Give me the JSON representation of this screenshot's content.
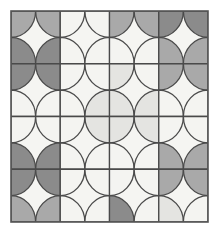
{
  "figure": {
    "background_color": "#ffffff"
  },
  "frame": {
    "name": "outer-border",
    "x": 11,
    "y": 11,
    "width": 197,
    "height": 211,
    "stroke_color": "#555555",
    "stroke_width": 1.6,
    "fill_color": "#f5f5f2"
  },
  "grid": {
    "columns": 4,
    "rows": 4,
    "cell_width": 49.25,
    "cell_height": 52.75,
    "origin_x": 11,
    "origin_y": 11
  },
  "palette": {
    "offwhite": "#f4f4f1",
    "light": "#e4e4e1",
    "medium": "#a9a9a9",
    "dark": "#8b8b8b",
    "stroke": "#4a4a4a"
  },
  "pattern": {
    "stroke_color": "#4a4a4a",
    "stroke_width": 1.3,
    "tone_names": [
      "offwhite",
      "light",
      "medium",
      "dark"
    ],
    "tiles": [
      {
        "row": 0,
        "col": 0,
        "corner": "tl",
        "tone": "medium"
      },
      {
        "row": 0,
        "col": 0,
        "corner": "tr",
        "tone": "medium"
      },
      {
        "row": 0,
        "col": 0,
        "corner": "bl",
        "tone": "dark"
      },
      {
        "row": 0,
        "col": 0,
        "corner": "br",
        "tone": "dark"
      },
      {
        "row": 0,
        "col": 1,
        "corner": "tl",
        "tone": "offwhite"
      },
      {
        "row": 0,
        "col": 1,
        "corner": "tr",
        "tone": "offwhite"
      },
      {
        "row": 0,
        "col": 1,
        "corner": "bl",
        "tone": "offwhite"
      },
      {
        "row": 0,
        "col": 1,
        "corner": "br",
        "tone": "offwhite"
      },
      {
        "row": 0,
        "col": 2,
        "corner": "tl",
        "tone": "medium"
      },
      {
        "row": 0,
        "col": 2,
        "corner": "tr",
        "tone": "medium"
      },
      {
        "row": 0,
        "col": 2,
        "corner": "bl",
        "tone": "offwhite"
      },
      {
        "row": 0,
        "col": 2,
        "corner": "br",
        "tone": "offwhite"
      },
      {
        "row": 0,
        "col": 3,
        "corner": "tl",
        "tone": "dark"
      },
      {
        "row": 0,
        "col": 3,
        "corner": "tr",
        "tone": "dark"
      },
      {
        "row": 0,
        "col": 3,
        "corner": "bl",
        "tone": "medium"
      },
      {
        "row": 0,
        "col": 3,
        "corner": "br",
        "tone": "medium"
      },
      {
        "row": 1,
        "col": 0,
        "corner": "tl",
        "tone": "dark"
      },
      {
        "row": 1,
        "col": 0,
        "corner": "tr",
        "tone": "dark"
      },
      {
        "row": 1,
        "col": 0,
        "corner": "bl",
        "tone": "offwhite"
      },
      {
        "row": 1,
        "col": 0,
        "corner": "br",
        "tone": "offwhite"
      },
      {
        "row": 1,
        "col": 1,
        "corner": "tl",
        "tone": "offwhite"
      },
      {
        "row": 1,
        "col": 1,
        "corner": "tr",
        "tone": "offwhite"
      },
      {
        "row": 1,
        "col": 1,
        "corner": "bl",
        "tone": "offwhite"
      },
      {
        "row": 1,
        "col": 1,
        "corner": "br",
        "tone": "light"
      },
      {
        "row": 1,
        "col": 2,
        "corner": "tl",
        "tone": "light"
      },
      {
        "row": 1,
        "col": 2,
        "corner": "tr",
        "tone": "offwhite"
      },
      {
        "row": 1,
        "col": 2,
        "corner": "bl",
        "tone": "light"
      },
      {
        "row": 1,
        "col": 2,
        "corner": "br",
        "tone": "light"
      },
      {
        "row": 1,
        "col": 3,
        "corner": "tl",
        "tone": "medium"
      },
      {
        "row": 1,
        "col": 3,
        "corner": "tr",
        "tone": "medium"
      },
      {
        "row": 1,
        "col": 3,
        "corner": "bl",
        "tone": "offwhite"
      },
      {
        "row": 1,
        "col": 3,
        "corner": "br",
        "tone": "offwhite"
      },
      {
        "row": 2,
        "col": 0,
        "corner": "tl",
        "tone": "offwhite"
      },
      {
        "row": 2,
        "col": 0,
        "corner": "tr",
        "tone": "offwhite"
      },
      {
        "row": 2,
        "col": 0,
        "corner": "bl",
        "tone": "dark"
      },
      {
        "row": 2,
        "col": 0,
        "corner": "br",
        "tone": "dark"
      },
      {
        "row": 2,
        "col": 1,
        "corner": "tl",
        "tone": "offwhite"
      },
      {
        "row": 2,
        "col": 1,
        "corner": "tr",
        "tone": "light"
      },
      {
        "row": 2,
        "col": 1,
        "corner": "bl",
        "tone": "offwhite"
      },
      {
        "row": 2,
        "col": 1,
        "corner": "br",
        "tone": "offwhite"
      },
      {
        "row": 2,
        "col": 2,
        "corner": "tl",
        "tone": "light"
      },
      {
        "row": 2,
        "col": 2,
        "corner": "tr",
        "tone": "light"
      },
      {
        "row": 2,
        "col": 2,
        "corner": "bl",
        "tone": "offwhite"
      },
      {
        "row": 2,
        "col": 2,
        "corner": "br",
        "tone": "offwhite"
      },
      {
        "row": 2,
        "col": 3,
        "corner": "tl",
        "tone": "offwhite"
      },
      {
        "row": 2,
        "col": 3,
        "corner": "tr",
        "tone": "offwhite"
      },
      {
        "row": 2,
        "col": 3,
        "corner": "bl",
        "tone": "medium"
      },
      {
        "row": 2,
        "col": 3,
        "corner": "br",
        "tone": "medium"
      },
      {
        "row": 3,
        "col": 0,
        "corner": "tl",
        "tone": "dark"
      },
      {
        "row": 3,
        "col": 0,
        "corner": "tr",
        "tone": "dark"
      },
      {
        "row": 3,
        "col": 0,
        "corner": "bl",
        "tone": "medium"
      },
      {
        "row": 3,
        "col": 0,
        "corner": "br",
        "tone": "medium"
      },
      {
        "row": 3,
        "col": 1,
        "corner": "tl",
        "tone": "offwhite"
      },
      {
        "row": 3,
        "col": 1,
        "corner": "tr",
        "tone": "offwhite"
      },
      {
        "row": 3,
        "col": 1,
        "corner": "bl",
        "tone": "offwhite"
      },
      {
        "row": 3,
        "col": 1,
        "corner": "br",
        "tone": "offwhite"
      },
      {
        "row": 3,
        "col": 2,
        "corner": "tl",
        "tone": "offwhite"
      },
      {
        "row": 3,
        "col": 2,
        "corner": "tr",
        "tone": "offwhite"
      },
      {
        "row": 3,
        "col": 2,
        "corner": "bl",
        "tone": "dark"
      },
      {
        "row": 3,
        "col": 2,
        "corner": "br",
        "tone": "offwhite"
      },
      {
        "row": 3,
        "col": 3,
        "corner": "tl",
        "tone": "medium"
      },
      {
        "row": 3,
        "col": 3,
        "corner": "tr",
        "tone": "medium"
      },
      {
        "row": 3,
        "col": 3,
        "corner": "bl",
        "tone": "light"
      },
      {
        "row": 3,
        "col": 3,
        "corner": "br",
        "tone": "offwhite"
      }
    ]
  }
}
